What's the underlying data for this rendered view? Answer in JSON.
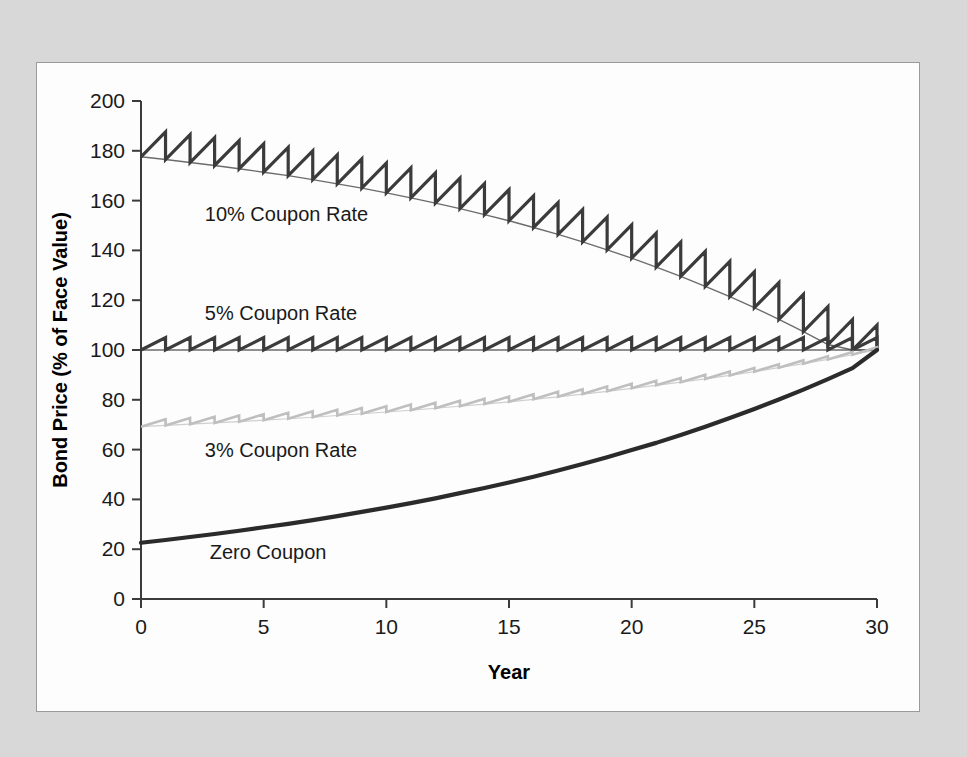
{
  "figure": {
    "background_color": "#d8d8d8",
    "panel_color": "#fdfdfd",
    "panel_border_color": "#9a9a9a"
  },
  "chart_data": {
    "type": "line",
    "title": "",
    "subtitle": "",
    "xlabel": "Year",
    "ylabel": "Bond Price (% of Face Value)",
    "xlim": [
      0,
      30
    ],
    "ylim": [
      0,
      200
    ],
    "xticks": [
      0,
      5,
      10,
      15,
      20,
      25,
      30
    ],
    "xtick_labels": [
      "0",
      "5",
      "10",
      "15",
      "20",
      "25",
      "30"
    ],
    "yticks": [
      0,
      20,
      40,
      60,
      80,
      100,
      120,
      140,
      160,
      180,
      200
    ],
    "ytick_labels": [
      "0",
      "20",
      "40",
      "60",
      "80",
      "100",
      "120",
      "140",
      "160",
      "180",
      "200"
    ],
    "grid": false,
    "legend_position": "inline-annotations",
    "annotations": [
      {
        "text": "10% Coupon Rate",
        "x": 2.6,
        "y": 152,
        "color": "#1a1a1a"
      },
      {
        "text": "5% Coupon Rate",
        "x": 2.6,
        "y": 112,
        "color": "#1a1a1a"
      },
      {
        "text": "3% Coupon Rate",
        "x": 2.6,
        "y": 57,
        "color": "#1a1a1a"
      },
      {
        "text": "Zero Coupon",
        "x": 2.8,
        "y": 16,
        "color": "#1a1a1a"
      }
    ],
    "series": [
      {
        "name": "10% Coupon Rate",
        "color": "#3b3b3b",
        "line_width": 3.2,
        "sawtooth": true,
        "coupon_per_period": 10,
        "floor_start": 177.6,
        "floor_end": 100,
        "values_floor": [
          177.6,
          176.5,
          175.3,
          174.1,
          172.8,
          171.4,
          170.0,
          168.4,
          166.7,
          165.0,
          163.1,
          161.1,
          159.0,
          156.8,
          154.4,
          151.9,
          149.2,
          146.4,
          143.4,
          140.2,
          136.9,
          133.3,
          129.6,
          125.6,
          121.4,
          117.0,
          112.3,
          107.4,
          102.2,
          100.0,
          100.0
        ],
        "values_peak": [
          187.6,
          186.5,
          185.3,
          184.1,
          182.8,
          181.4,
          180.0,
          178.4,
          176.7,
          175.0,
          173.1,
          171.1,
          169.0,
          166.8,
          164.4,
          161.9,
          159.2,
          156.4,
          153.4,
          150.2,
          146.9,
          143.3,
          139.6,
          135.6,
          131.4,
          127.0,
          122.3,
          117.4,
          112.2,
          110.0
        ]
      },
      {
        "name": "5% Coupon Rate",
        "color": "#3b3b3b",
        "line_width": 3.2,
        "sawtooth": true,
        "coupon_per_period": 5,
        "floor_start": 100.0,
        "floor_end": 100.0,
        "values_floor": [
          100,
          100,
          100,
          100,
          100,
          100,
          100,
          100,
          100,
          100,
          100,
          100,
          100,
          100,
          100,
          100,
          100,
          100,
          100,
          100,
          100,
          100,
          100,
          100,
          100,
          100,
          100,
          100,
          100,
          100,
          100
        ],
        "values_peak": [
          105,
          105,
          105,
          105,
          105,
          105,
          105,
          105,
          105,
          105,
          105,
          105,
          105,
          105,
          105,
          105,
          105,
          105,
          105,
          105,
          105,
          105,
          105,
          105,
          105,
          105,
          105,
          105,
          105,
          105
        ]
      },
      {
        "name": "3% Coupon Rate",
        "color": "#bfbfbf",
        "line_width": 2.6,
        "sawtooth": true,
        "coupon_per_period": 3,
        "floor_start": 69.2,
        "floor_end": 100.0,
        "values_floor": [
          69.2,
          69.7,
          70.2,
          70.7,
          71.2,
          71.8,
          72.4,
          73.0,
          73.7,
          74.4,
          75.1,
          75.8,
          76.6,
          77.4,
          78.3,
          79.2,
          80.2,
          81.2,
          82.3,
          83.4,
          84.6,
          85.8,
          87.1,
          88.4,
          89.8,
          91.3,
          92.9,
          94.5,
          96.2,
          98.1,
          100.0
        ],
        "values_peak": [
          72.2,
          72.7,
          73.2,
          73.7,
          74.2,
          74.8,
          75.4,
          76.0,
          76.7,
          77.4,
          78.1,
          78.8,
          79.6,
          80.4,
          81.3,
          82.2,
          83.2,
          84.2,
          85.3,
          86.4,
          87.6,
          88.8,
          90.1,
          91.4,
          92.8,
          94.3,
          95.9,
          97.5,
          99.2,
          101.1
        ]
      },
      {
        "name": "Zero Coupon",
        "color": "#2b2b2b",
        "line_width": 4.2,
        "sawtooth": false,
        "coupon_per_period": 0,
        "floor_start": 22.6,
        "floor_end": 100.0,
        "values_floor": [
          22.6,
          23.7,
          24.9,
          26.1,
          27.4,
          28.8,
          30.2,
          31.7,
          33.3,
          35.0,
          36.7,
          38.5,
          40.4,
          42.5,
          44.6,
          46.8,
          49.1,
          51.6,
          54.2,
          56.9,
          59.8,
          62.7,
          65.9,
          69.2,
          72.7,
          76.3,
          80.1,
          84.1,
          88.3,
          92.7,
          100.0
        ]
      }
    ]
  }
}
